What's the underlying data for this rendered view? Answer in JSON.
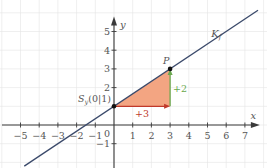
{
  "diagram": {
    "type": "coordinate-system",
    "x_axis": {
      "label": "x",
      "range": [
        -5.5,
        7.8
      ],
      "ticks": [
        -5,
        -4,
        -3,
        -2,
        -1,
        1,
        2,
        3,
        4,
        5,
        6,
        7
      ],
      "tick_labels": [
        "−5",
        "−4",
        "−3",
        "−2",
        "−1",
        "1",
        "2",
        "3",
        "4",
        "5",
        "6",
        "7"
      ]
    },
    "y_axis": {
      "label": "y",
      "range": [
        -2,
        5.8
      ],
      "ticks": [
        -1,
        2,
        3,
        4,
        5
      ],
      "tick_labels": [
        "−1",
        "2",
        "3",
        "4",
        "5"
      ]
    },
    "origin_label": "0",
    "line": {
      "name": "K",
      "subscript": "f",
      "slope": 0.6667,
      "intercept": 1,
      "x_range": [
        -4.8,
        7.7
      ],
      "color": "#3b4a6b"
    },
    "points": [
      {
        "name": "S",
        "subscript": "y",
        "coords": "(0|1)",
        "x": 0,
        "y": 1
      },
      {
        "name": "P",
        "x": 3,
        "y": 3
      }
    ],
    "slope_triangle": {
      "fill": "#f3a582",
      "run": {
        "label": "+3",
        "color": "#c0392b"
      },
      "rise": {
        "label": "+2",
        "color": "#6aa84f"
      }
    }
  }
}
